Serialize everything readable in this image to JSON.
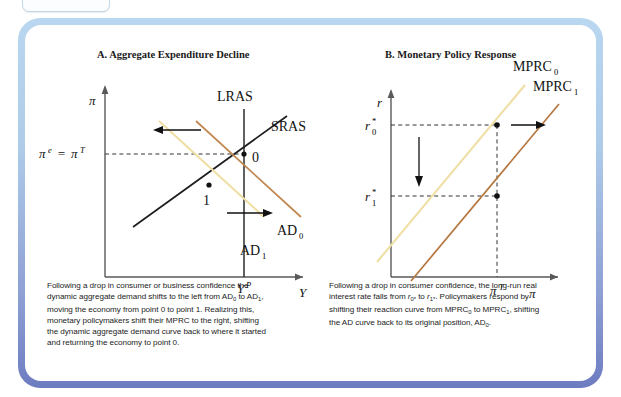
{
  "figure": {
    "frame_color_top": "#b9d7f0",
    "frame_color_bottom": "#6d7cc0",
    "background": "#ffffff"
  },
  "panels": [
    {
      "id": "A",
      "title": "A. Aggregate Expenditure Decline",
      "axes": {
        "y_axis_label": "π",
        "x_axis_label": "Y",
        "y_tick_label": "π",
        "y_tick_label_full": "π e = π T",
        "x_tick_label": "Y",
        "x_tick_sup": "P"
      },
      "curves": [
        {
          "name": "LRAS",
          "label": "LRAS",
          "color": "#2b2b2b",
          "kind": "vertical"
        },
        {
          "name": "SRAS",
          "label": "SRAS",
          "color": "#1d1d1d",
          "kind": "upward"
        },
        {
          "name": "AD0",
          "label": "AD",
          "sub": "0",
          "color": "#c0864e",
          "kind": "downward"
        },
        {
          "name": "AD1",
          "label": "AD",
          "sub": "1",
          "color": "#efdfa4",
          "kind": "downward"
        }
      ],
      "points": [
        {
          "label": "0",
          "desc": "initial equilibrium at LRAS and pi-target"
        },
        {
          "label": "1",
          "desc": "new equilibrium after AD shifts left"
        }
      ],
      "arrows": [
        {
          "name": "ad-shift-left-arrow",
          "direction": "left"
        },
        {
          "name": "ad-shift-right-arrow",
          "direction": "right"
        }
      ]
    },
    {
      "id": "B",
      "title": "B. Monetary Policy Response",
      "axes": {
        "y_axis_label": "r",
        "x_axis_label": "π",
        "y_tick_labels": [
          "r 0 *",
          "r 1 *"
        ],
        "x_tick_label": "π",
        "x_tick_sup": "T"
      },
      "curves": [
        {
          "name": "MPRC0",
          "label": "MPRC",
          "sub": "0",
          "color": "#efdfa4",
          "kind": "upward"
        },
        {
          "name": "MPRC1",
          "label": "MPRC",
          "sub": "1",
          "color": "#b5763f",
          "kind": "upward"
        }
      ],
      "points": [
        {
          "label": "",
          "desc": "r0* on MPRC0 at pi-target"
        },
        {
          "label": "",
          "desc": "r1* on MPRC1 at pi-target"
        }
      ],
      "arrows": [
        {
          "name": "rate-fall-arrow",
          "direction": "down"
        },
        {
          "name": "mprc-shift-right-arrow",
          "direction": "right"
        }
      ]
    }
  ],
  "captions": {
    "a": {
      "lines": [
        "Following a drop in consumer or business confidence the",
        "dynamic aggregate demand shifts to the left from AD0 to AD1,",
        "moving the economy from point 0 to point 1. Realizing this,",
        "monetary policymakers shift their MPRC to the right, shifting",
        "the dynamic aggregate demand curve back to where it started",
        "and returning the economy to point 0."
      ]
    },
    "b": {
      "lines": [
        "Following a drop in consumer confidence, the long-run real",
        "interest rate falls from r0* to r1*. Policymakers respond by",
        "shifting their reaction curve from MPRC0 to MPRC1, shifting",
        "the AD curve back to its original position, AD0."
      ]
    }
  }
}
